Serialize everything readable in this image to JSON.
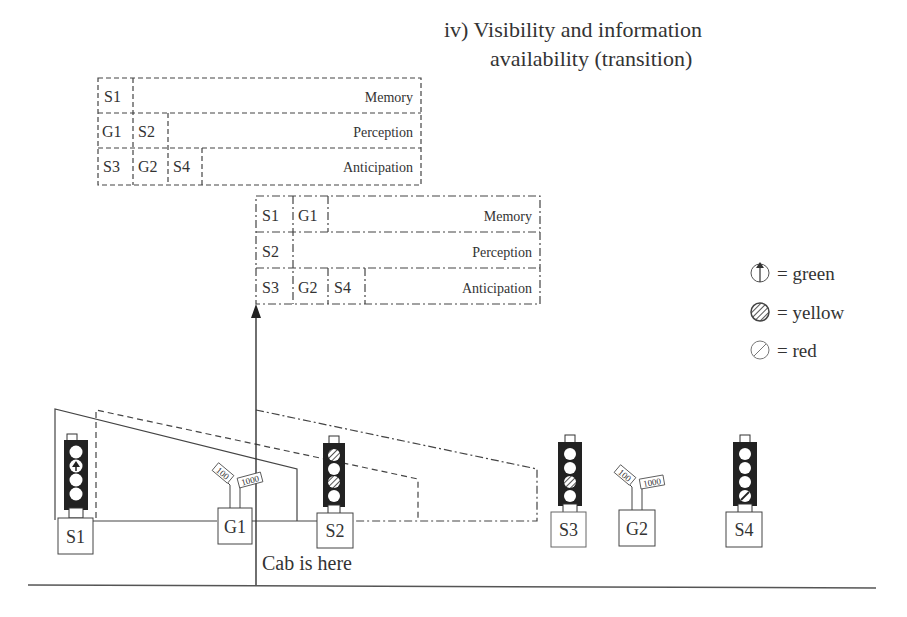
{
  "title": {
    "line1": "iv)  Visibility and information",
    "line2": "availability (transition)"
  },
  "panel_left": {
    "rows": [
      {
        "cells": [
          "S1"
        ],
        "label": "Memory"
      },
      {
        "cells": [
          "G1",
          "S2"
        ],
        "label": "Perception"
      },
      {
        "cells": [
          "S3",
          "G2",
          "S4"
        ],
        "label": "Anticipation"
      }
    ]
  },
  "panel_right": {
    "rows": [
      {
        "cells": [
          "S1",
          "G1"
        ],
        "label": "Memory"
      },
      {
        "cells": [
          "S2"
        ],
        "label": "Perception"
      },
      {
        "cells": [
          "S3",
          "G2",
          "S4"
        ],
        "label": "Anticipation"
      }
    ]
  },
  "legend": [
    {
      "icon": "green-light-icon",
      "text": "= green"
    },
    {
      "icon": "yellow-light-icon",
      "text": "= yellow"
    },
    {
      "icon": "red-light-icon",
      "text": "= red"
    }
  ],
  "objects": {
    "s1": "S1",
    "g1": "G1",
    "s2": "S2",
    "s3": "S3",
    "g2": "G2",
    "s4": "S4",
    "g1_sign_a": "100",
    "g1_sign_b": "1000",
    "g2_sign_a": "100",
    "g2_sign_b": "1000"
  },
  "cab_label": "Cab is here"
}
